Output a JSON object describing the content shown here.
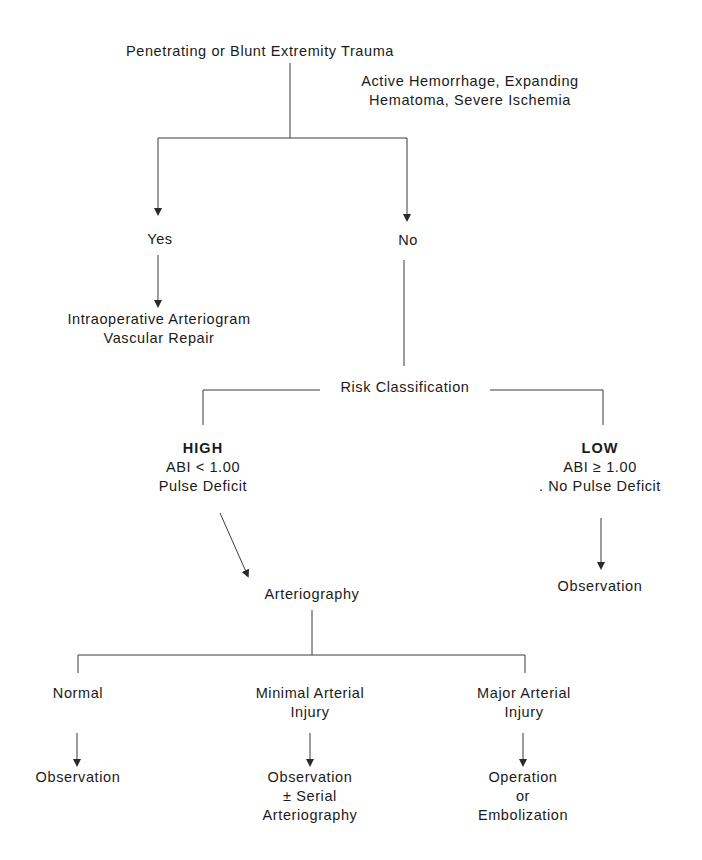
{
  "diagram": {
    "type": "flowchart",
    "root": {
      "label": "Penetrating or Blunt Extremity Trauma"
    },
    "decision": {
      "question_lines": [
        "Active Hemorrhage, Expanding",
        "Hematoma, Severe Ischemia"
      ],
      "yes_label": "Yes",
      "no_label": "No"
    },
    "yes_branch": {
      "outcome_lines": [
        "Intraoperative Arteriogram",
        "Vascular Repair"
      ]
    },
    "risk": {
      "label": "Risk Classification",
      "high": {
        "title": "HIGH",
        "criteria": [
          "ABI < 1.00",
          "Pulse Deficit"
        ]
      },
      "low": {
        "title": "LOW",
        "criteria": [
          "ABI ≥ 1.00",
          ". No Pulse Deficit"
        ],
        "outcome": "Observation"
      }
    },
    "arteriography": {
      "label": "Arteriography",
      "results": [
        {
          "finding_lines": [
            "Normal"
          ],
          "outcome_lines": [
            "Observation"
          ]
        },
        {
          "finding_lines": [
            "Minimal Arterial",
            "Injury"
          ],
          "outcome_lines": [
            "Observation",
            "± Serial",
            "Arteriography"
          ]
        },
        {
          "finding_lines": [
            "Major Arterial",
            "Injury"
          ],
          "outcome_lines": [
            "Operation",
            "or",
            "Embolization"
          ]
        }
      ]
    },
    "colors": {
      "line": "#3a3a3a",
      "text": "#1a1a1a",
      "background": "#ffffff"
    }
  }
}
